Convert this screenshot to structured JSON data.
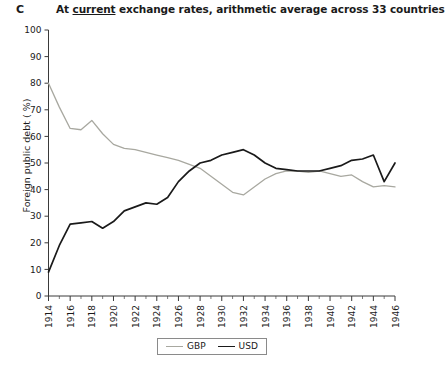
{
  "panel": {
    "label": "C"
  },
  "title": {
    "before": "At ",
    "underlined": "current",
    "after": " exchange rates, arithmetic average across 33 countries",
    "full": "At current exchange rates, arithmetic average across 33 countries"
  },
  "legend": {
    "position": "bottom-center",
    "entries": [
      {
        "label": "GBP",
        "color": "#a8a8a0"
      },
      {
        "label": "USD",
        "color": "#1a1a1a"
      }
    ]
  },
  "chart_data": {
    "type": "line",
    "title": "At current exchange rates, arithmetic average across 33 countries",
    "xlabel": "",
    "ylabel": "Foreign public debt ( %)",
    "xlim": [
      1914,
      1946
    ],
    "ylim": [
      0,
      100
    ],
    "grid": false,
    "ytick_labels": [
      "0",
      "10",
      "20",
      "30",
      "40",
      "50",
      "60",
      "70",
      "80",
      "90",
      "100"
    ],
    "ytick_values": [
      0,
      10,
      20,
      30,
      40,
      50,
      60,
      70,
      80,
      90,
      100
    ],
    "xtick_labels": [
      "1914",
      "1916",
      "1918",
      "1920",
      "1922",
      "1924",
      "1926",
      "1928",
      "1930",
      "1932",
      "1934",
      "1936",
      "1938",
      "1940",
      "1942",
      "1944",
      "1946"
    ],
    "xtick_values": [
      1914,
      1916,
      1918,
      1920,
      1922,
      1924,
      1926,
      1928,
      1930,
      1932,
      1934,
      1936,
      1938,
      1940,
      1942,
      1944,
      1946
    ],
    "x": [
      1914,
      1915,
      1916,
      1917,
      1918,
      1919,
      1920,
      1921,
      1922,
      1923,
      1924,
      1925,
      1926,
      1927,
      1928,
      1929,
      1930,
      1931,
      1932,
      1933,
      1934,
      1935,
      1936,
      1937,
      1938,
      1939,
      1940,
      1941,
      1942,
      1943,
      1944,
      1945,
      1946
    ],
    "series": [
      {
        "name": "GBP",
        "color": "#a8a8a0",
        "values": [
          80,
          71,
          63,
          62.5,
          66,
          61,
          57,
          55.5,
          55,
          54,
          53,
          52,
          51,
          49.5,
          48,
          45,
          42,
          39,
          38,
          41,
          44,
          46,
          47,
          47,
          46.5,
          47,
          46,
          45,
          45.5,
          43,
          41,
          41.5,
          41
        ]
      },
      {
        "name": "USD",
        "color": "#1a1a1a",
        "values": [
          9,
          19,
          27,
          27.5,
          28,
          25.5,
          28,
          32,
          33.5,
          35,
          34.5,
          37,
          43,
          47,
          50,
          51,
          53,
          54,
          55,
          53,
          50,
          48,
          47.5,
          47,
          47,
          47,
          48,
          49,
          51,
          51.5,
          53,
          43,
          50
        ]
      }
    ]
  }
}
